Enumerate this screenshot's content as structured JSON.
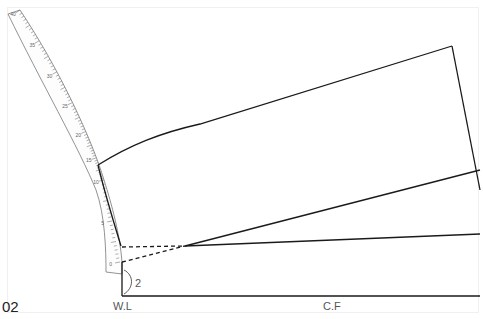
{
  "figure": {
    "number": "02",
    "labels": {
      "waist_line": "W.L",
      "center_front": "C.F",
      "measurement": "2"
    },
    "ruler": {
      "name": "french-curve-ruler",
      "tick_labels": [
        "40",
        "35",
        "30",
        "25",
        "20",
        "15",
        "10",
        "5",
        "0"
      ]
    },
    "colors": {
      "line": "#1a1a1a",
      "ruler": "#666666",
      "label": "#555555",
      "background": "#ffffff"
    }
  }
}
